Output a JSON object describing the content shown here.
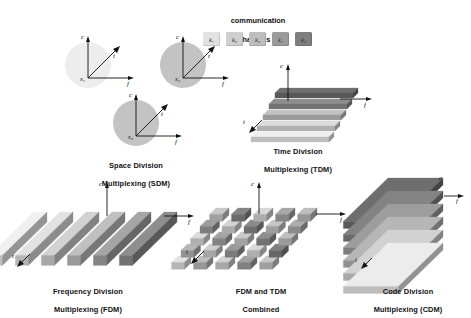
{
  "figure": {
    "title_top_line1": "communication",
    "title_top_line2": "channels kᵢ",
    "channels": [
      {
        "label": "k₁",
        "color": "#e2e2e2"
      },
      {
        "label": "k₂",
        "color": "#cfcfcf"
      },
      {
        "label": "k₃",
        "color": "#bdbdbd"
      },
      {
        "label": "k₄",
        "color": "#9b9b9b"
      },
      {
        "label": "k₅",
        "color": "#7e7e7e"
      }
    ],
    "axis_names": {
      "c": "c",
      "f": "f",
      "t": "t"
    },
    "palette": {
      "lightest": "#efefef",
      "light": "#dedede",
      "mid_light": "#cbcbcb",
      "mid": "#b4b4b4",
      "mid_dark": "#9a9a9a",
      "dark": "#818181",
      "darkest": "#6d6d6d",
      "outline": "#111111",
      "background": "#ffffff"
    }
  },
  "panels": {
    "sdm": {
      "caption_line1": "Space Division",
      "caption_line2": "Multiplexing (SDM)",
      "caption": "Space Division\nMultiplexing (SDM)",
      "cells": [
        {
          "label": "s₁",
          "fill": "#ededed"
        },
        {
          "label": "s₂",
          "fill": "#c3c3c3"
        },
        {
          "label": "s₃",
          "fill": "#c3c3c3"
        }
      ],
      "axes": [
        "c",
        "f",
        "t"
      ]
    },
    "tdm": {
      "caption_line1": "Time Division",
      "caption_line2": "Multiplexing (TDM)",
      "caption": "Time Division\nMultiplexing (TDM)",
      "axes": [
        "c",
        "f",
        "t"
      ],
      "slab_count": 5,
      "slab_colors": [
        "#6f6f6f",
        "#8e8e8e",
        "#c2c2c2",
        "#dcdcdc",
        "#efefef"
      ]
    },
    "fdm": {
      "caption_line1": "Frequency Division",
      "caption_line2": "Multiplexing (FDM)",
      "caption": "Frequency Division\nMultiplexing (FDM)",
      "axes": [
        "c",
        "f",
        "t"
      ],
      "slab_count": 6,
      "slab_colors": [
        "#f0f0f0",
        "#e2e2e2",
        "#d2d2d2",
        "#c0c0c0",
        "#a5a5a5",
        "#8e8e8e"
      ]
    },
    "combined": {
      "caption_line1": "FDM and TDM",
      "caption_line2": "Combined",
      "caption": "FDM and TDM\nCombined",
      "axes": [
        "c",
        "f",
        "t"
      ],
      "rows": 5,
      "cols": 5,
      "block_colors": [
        [
          "#c9c9c9",
          "#858585",
          "#d8d8d8",
          "#a8a8a8",
          "#bdbdbd"
        ],
        [
          "#9d9d9d",
          "#d4d4d4",
          "#8b8b8b",
          "#c6c6c6",
          "#aeaeae"
        ],
        [
          "#dcdcdc",
          "#a3a3a3",
          "#cacaca",
          "#8f8f8f",
          "#c0c0c0"
        ],
        [
          "#b6b6b6",
          "#cfcfcf",
          "#9a9a9a",
          "#dadada",
          "#7f7f7f"
        ],
        [
          "#e4e4e4",
          "#bdbdbd",
          "#d2d2d2",
          "#a0a0a0",
          "#c8c8c8"
        ]
      ]
    },
    "cdm": {
      "caption_line1": "Code Division",
      "caption_line2": "Multiplexing (CDM)",
      "caption": "Code Division\nMultiplexing (CDM)",
      "axes": [
        "c",
        "f",
        "t"
      ],
      "slab_count": 6,
      "slab_colors": [
        "#6e6e6e",
        "#838383",
        "#9d9d9d",
        "#b6b6b6",
        "#d2d2d2",
        "#ececec"
      ]
    }
  }
}
